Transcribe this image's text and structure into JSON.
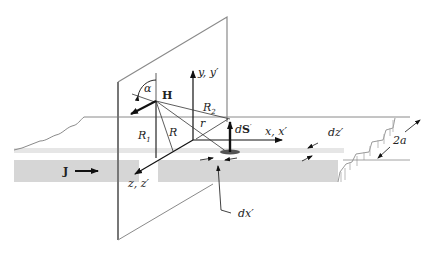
{
  "figure": {
    "type": "physics-diagram",
    "colors": {
      "line": "#7a7a7a",
      "dark": "#111111",
      "slab_front": "#d6d6d6",
      "slab_top_strip": "#e3e3e3",
      "background": "#ffffff"
    },
    "labels": {
      "alpha": "α",
      "H": "H",
      "y_axis": "y, y′",
      "R2": "R",
      "R2_sub": "2",
      "R1": "R",
      "R1_sub": "1",
      "R": "R",
      "r": "r",
      "dS_d": "d",
      "dS_S": "S",
      "dS_prime": "′",
      "x_axis": "x, x′",
      "dz": "dz′",
      "thickness": "2a",
      "J": "J",
      "z_axis": "z, z′",
      "dx": "dx′"
    }
  }
}
